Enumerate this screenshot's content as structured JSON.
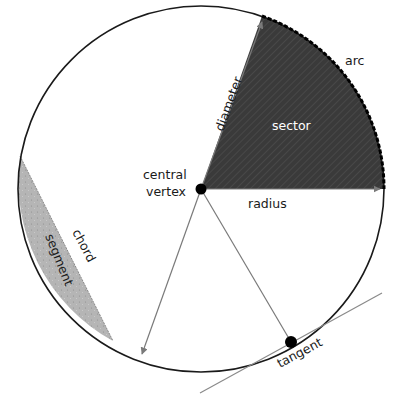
{
  "diagram": {
    "labels": {
      "arc": "arc",
      "diameter": "diameter",
      "sector": "sector",
      "central_vertex_line1": "central",
      "central_vertex_line2": "vertex",
      "radius": "radius",
      "chord": "chord",
      "segment": "segment",
      "tangent": "tangent"
    },
    "colors": {
      "circle_stroke": "#1a1a1a",
      "sector_fill": "#3a3a3a",
      "segment_fill": "#b5b5b5",
      "arrow_line": "#7a7a7a",
      "point": "#000000"
    }
  }
}
